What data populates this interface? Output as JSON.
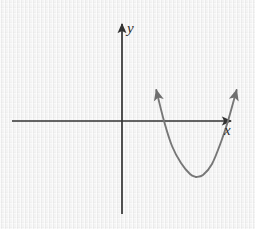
{
  "figure": {
    "kind": "cartesian-graph",
    "width": 255,
    "height": 229,
    "background_color": "#f2f2f2",
    "axis_color": "#333333",
    "curve_color": "#777777"
  },
  "axes": {
    "x_label": "x",
    "y_label": "y",
    "origin": {
      "x": 122,
      "y": 121
    },
    "x_axis": {
      "start_x": 12,
      "end_x": 233,
      "y": 121,
      "arrow": "right"
    },
    "y_axis": {
      "x": 122,
      "start_y": 214,
      "end_y": 22,
      "arrow": "up"
    }
  },
  "chart_data": {
    "type": "line",
    "title": "",
    "xlabel": "x",
    "ylabel": "y",
    "grid": false,
    "legend": null,
    "annotations": [
      "upward-opening parabola with vertex below the x-axis",
      "two x-intercepts, both to the right of the origin",
      "arrowheads on both ends of the curve indicating continuation"
    ],
    "series": [
      {
        "name": "parabola",
        "shape": "upward-opening-parabola",
        "color": "#777777",
        "vertex_px": {
          "x": 196,
          "y": 177
        },
        "x_intercepts_px": [
          164,
          228
        ],
        "arrow_ends_px": [
          {
            "x": 155,
            "y": 85
          },
          {
            "x": 238,
            "y": 85
          }
        ],
        "points_px": [
          {
            "x": 155,
            "y": 85
          },
          {
            "x": 164,
            "y": 121
          },
          {
            "x": 172,
            "y": 146
          },
          {
            "x": 181,
            "y": 163
          },
          {
            "x": 190,
            "y": 174
          },
          {
            "x": 196,
            "y": 177
          },
          {
            "x": 203,
            "y": 175
          },
          {
            "x": 212,
            "y": 164
          },
          {
            "x": 221,
            "y": 142
          },
          {
            "x": 228,
            "y": 121
          },
          {
            "x": 238,
            "y": 85
          }
        ]
      }
    ]
  }
}
